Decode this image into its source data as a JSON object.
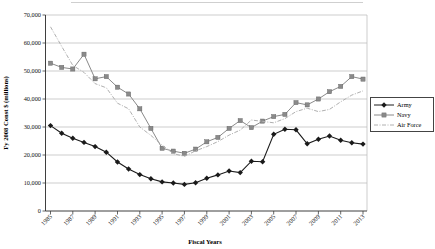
{
  "chart_data": {
    "type": "line",
    "title": "",
    "xlabel": "Fiscal Years",
    "ylabel": "Fy 2008 Const $ (millions)",
    "units": "FY2008 constant $ millions",
    "x": [
      1985,
      1986,
      1987,
      1988,
      1989,
      1990,
      1991,
      1992,
      1993,
      1994,
      1995,
      1996,
      1997,
      1998,
      1999,
      2000,
      2001,
      2002,
      2003,
      2004,
      2005,
      2006,
      2007,
      2008,
      2009,
      2010,
      2011,
      2012,
      2013
    ],
    "x_tick_years": [
      1985,
      1987,
      1989,
      1991,
      1993,
      1995,
      1997,
      1999,
      2001,
      2003,
      2005,
      2007,
      2009,
      2011,
      2013
    ],
    "ylim": [
      0,
      70000
    ],
    "ytick_values": [
      0,
      10000,
      20000,
      30000,
      40000,
      50000,
      60000,
      70000
    ],
    "ytick_labels": [
      "0",
      "10,000",
      "20,000",
      "30,000",
      "40,000",
      "50,000",
      "60,000",
      "70,000"
    ],
    "grid": true,
    "legend_position": "right",
    "series": [
      {
        "name": "Army",
        "marker": "diamond",
        "line": "solid",
        "color": "#1a1a1a",
        "values": [
          30500,
          27800,
          26000,
          24500,
          23000,
          21000,
          17500,
          15000,
          13000,
          11500,
          10400,
          10000,
          9500,
          10100,
          11700,
          12900,
          14300,
          13700,
          17800,
          17600,
          27400,
          29200,
          29000,
          24000,
          25600,
          26800,
          25300,
          24400,
          23900
        ]
      },
      {
        "name": "Navy",
        "marker": "square",
        "line": "solid",
        "color": "#8a8a8a",
        "values": [
          52800,
          51300,
          50700,
          56000,
          47200,
          48000,
          44200,
          41800,
          36500,
          29500,
          22400,
          21400,
          20600,
          22100,
          24700,
          26300,
          29500,
          32300,
          29800,
          32100,
          33700,
          34500,
          38700,
          37900,
          40000,
          42600,
          44500,
          48000,
          47100
        ]
      },
      {
        "name": "Air Force",
        "marker": "none",
        "line": "dash-dot",
        "color": "#b0b0b0",
        "values": [
          65800,
          58800,
          52000,
          49500,
          45500,
          44000,
          38500,
          36500,
          30000,
          27000,
          23500,
          20500,
          19500,
          21500,
          23000,
          24800,
          27100,
          28900,
          32500,
          32000,
          31500,
          33000,
          35500,
          36700,
          35500,
          36300,
          39000,
          41400,
          42900
        ]
      }
    ]
  }
}
